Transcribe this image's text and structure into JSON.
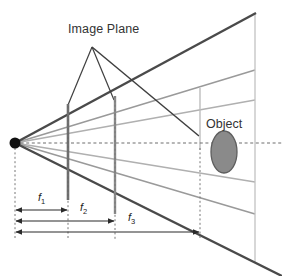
{
  "figure": {
    "type": "optics-ray-diagram",
    "title_label": "Image Plane",
    "object_label": "Object",
    "colors": {
      "dark_ray": "#4a4a4a",
      "mid_ray": "#8c8c8c",
      "light_ray": "#b8b8b8",
      "plane": "#6b6b6b",
      "axis": "#6f6f6f",
      "object_fill": "#8a8a8a",
      "object_stroke": "#5e5e5e",
      "measure": "#2b2b2b",
      "text": "#333333",
      "background": "#ffffff"
    },
    "labels": {
      "image_plane": "Image Plane",
      "object": "Object",
      "f1": "f",
      "f1_sub": "1",
      "f2": "f",
      "f2_sub": "2",
      "f3": "f",
      "f3_sub": "3"
    },
    "camera_center": {
      "x": 15,
      "y": 143,
      "radius": 5.5
    },
    "image_planes": [
      {
        "name": "plane-f1",
        "x": 68,
        "y_top": 104,
        "y_bottom": 200
      },
      {
        "name": "plane-f2",
        "x": 115,
        "y_top": 96,
        "y_bottom": 214
      },
      {
        "name": "plane-f3",
        "x": 200,
        "y_top": 88,
        "y_bottom": 246
      }
    ],
    "optical_axis": {
      "y": 143,
      "x_start": 15,
      "x_end": 282,
      "style": "dashed"
    },
    "frustum": {
      "far_plane_x": 255,
      "top_edge": {
        "x1": 15,
        "y1": 143,
        "x2": 255,
        "y2": 13
      },
      "bottom_edge": {
        "x1": 15,
        "y1": 143,
        "x2": 282,
        "y2": 276
      },
      "upper_rays_y_at_far": [
        70,
        100
      ],
      "lower_rays_y_at_far": [
        182,
        214
      ]
    },
    "object": {
      "cx": 224,
      "cy": 152,
      "rx": 13,
      "ry": 21
    },
    "measures": [
      {
        "name": "f1",
        "x_start": 15,
        "x_end": 68,
        "y": 210,
        "label": "f",
        "sub": "1"
      },
      {
        "name": "f2",
        "x_start": 15,
        "x_end": 115,
        "y": 221,
        "label": "f",
        "sub": "2"
      },
      {
        "name": "f3",
        "x_start": 15,
        "x_end": 200,
        "y": 232,
        "label": "f",
        "sub": "3"
      }
    ],
    "leader_lines": {
      "apex": {
        "x": 92,
        "y": 47
      },
      "targets": [
        {
          "x": 68,
          "y": 104
        },
        {
          "x": 115,
          "y": 96
        }
      ]
    },
    "dotted_verticals": [
      {
        "x": 15,
        "y_top": 148,
        "y_bottom": 240
      },
      {
        "x": 68,
        "y_top": 104,
        "y_bottom": 240
      },
      {
        "x": 115,
        "y_top": 96,
        "y_bottom": 240
      },
      {
        "x": 200,
        "y_top": 150,
        "y_bottom": 240
      }
    ]
  }
}
